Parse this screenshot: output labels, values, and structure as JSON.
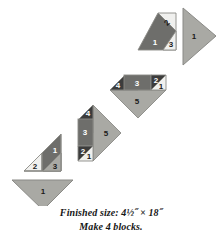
{
  "figure": {
    "kind": "quilt-block-assembly-diagram",
    "caption_line_1": "Finished size: 4½˝ × 18˝",
    "caption_line_2": "Make 4 blocks.",
    "colors": {
      "light": "#f0f0ee",
      "medium": "#a9a9a4",
      "medium_dark": "#8f8f8a",
      "dark": "#6e6e6b",
      "very_dark": "#3c3c3c",
      "outline": "#8a8a86",
      "background": "#ffffff",
      "label_dark": "#1a1a1a",
      "label_light": "#ffffff"
    },
    "units": [
      {
        "id": "unit-bottom-triangle",
        "name": "bottom-left-setting-triangle",
        "patches": [
          {
            "label": "1",
            "shade": "medium"
          }
        ]
      },
      {
        "id": "unit-1",
        "name": "pieced-unit-lower-left",
        "patches": [
          {
            "label": "2",
            "shade": "light"
          },
          {
            "label": "1",
            "shade": "dark"
          },
          {
            "label": "3",
            "shade": "medium"
          }
        ]
      },
      {
        "id": "unit-2",
        "name": "pieced-unit-lower-middle",
        "patches": [
          {
            "label": "4",
            "shade": "very_dark"
          },
          {
            "label": "3",
            "shade": "dark"
          },
          {
            "label": "2",
            "shade": "very_dark"
          },
          {
            "label": "1",
            "shade": "light"
          },
          {
            "label": "5",
            "shade": "medium"
          }
        ]
      },
      {
        "id": "unit-3",
        "name": "pieced-unit-upper-middle",
        "patches": [
          {
            "label": "4",
            "shade": "very_dark"
          },
          {
            "label": "3",
            "shade": "dark"
          },
          {
            "label": "2",
            "shade": "very_dark"
          },
          {
            "label": "1",
            "shade": "light"
          },
          {
            "label": "5",
            "shade": "medium"
          }
        ]
      },
      {
        "id": "unit-4",
        "name": "pieced-unit-upper-right",
        "patches": [
          {
            "label": "2",
            "shade": "light"
          },
          {
            "label": "1",
            "shade": "dark"
          },
          {
            "label": "3",
            "shade": "light"
          }
        ]
      },
      {
        "id": "unit-top-triangle",
        "name": "top-right-setting-triangle",
        "patches": [
          {
            "label": "1",
            "shade": "medium"
          }
        ]
      }
    ]
  }
}
